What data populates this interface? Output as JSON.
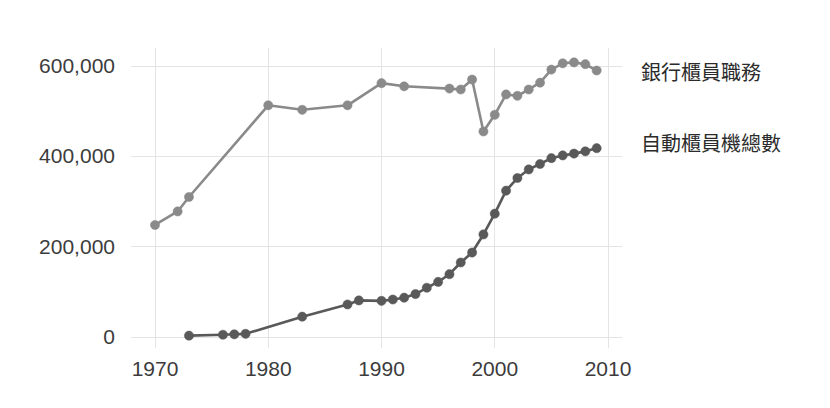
{
  "chart_data": {
    "type": "line",
    "title": "",
    "xlabel": "",
    "ylabel": "",
    "xlim": [
      1968,
      2011
    ],
    "ylim": [
      -35000,
      640000
    ],
    "grid": true,
    "legend_position": "right",
    "x_ticks": [
      "1970",
      "1980",
      "1990",
      "2000",
      "2010"
    ],
    "x_tick_values": [
      1970,
      1980,
      1990,
      2000,
      2010
    ],
    "y_ticks": [
      "0",
      "200,000",
      "400,000",
      "600,000"
    ],
    "y_tick_values": [
      0,
      200000,
      400000,
      600000
    ],
    "series": [
      {
        "name": "銀行櫃員職務",
        "color": "#8a8a8a",
        "marker": "circle",
        "x": [
          1970,
          1972,
          1973,
          1980,
          1983,
          1987,
          1990,
          1992,
          1996,
          1997,
          1998,
          1999,
          2000,
          2001,
          2002,
          2003,
          2004,
          2005,
          2006,
          2007,
          2008,
          2009
        ],
        "values": [
          248000,
          278000,
          310000,
          513000,
          503000,
          513000,
          562000,
          555000,
          550000,
          548000,
          570000,
          455000,
          492000,
          537000,
          534000,
          548000,
          563000,
          592000,
          606000,
          608000,
          604000,
          590000
        ]
      },
      {
        "name": "自動櫃員機總數",
        "color": "#595959",
        "marker": "circle",
        "x": [
          1973,
          1976,
          1977,
          1978,
          1983,
          1987,
          1988,
          1990,
          1991,
          1992,
          1993,
          1994,
          1995,
          1996,
          1997,
          1998,
          1999,
          2000,
          2001,
          2002,
          2003,
          2004,
          2005,
          2006,
          2007,
          2008,
          2009
        ],
        "values": [
          3000,
          5000,
          6000,
          7000,
          45000,
          72000,
          81000,
          80000,
          83000,
          87000,
          95000,
          109000,
          122000,
          139000,
          165000,
          187000,
          227000,
          273000,
          324000,
          352000,
          371000,
          383000,
          396000,
          402000,
          406000,
          411000,
          418000
        ]
      }
    ],
    "legend_entries": [
      {
        "label": "銀行櫃員職務",
        "color": "#8a8a8a"
      },
      {
        "label": "自動櫃員機總數",
        "color": "#595959"
      }
    ]
  },
  "legend": {
    "teller_label": "銀行櫃員職務",
    "atm_label": "自動櫃員機總數"
  },
  "axes": {
    "y_tick_0": "0",
    "y_tick_1": "200,000",
    "y_tick_2": "400,000",
    "y_tick_3": "600,000",
    "x_tick_0": "1970",
    "x_tick_1": "1980",
    "x_tick_2": "1990",
    "x_tick_3": "2000",
    "x_tick_4": "2010"
  },
  "colors": {
    "background": "#ffffff",
    "grid": "#e4e4e4",
    "text": "#3c3c3c",
    "series_teller": "#8a8a8a",
    "series_atm": "#595959"
  }
}
